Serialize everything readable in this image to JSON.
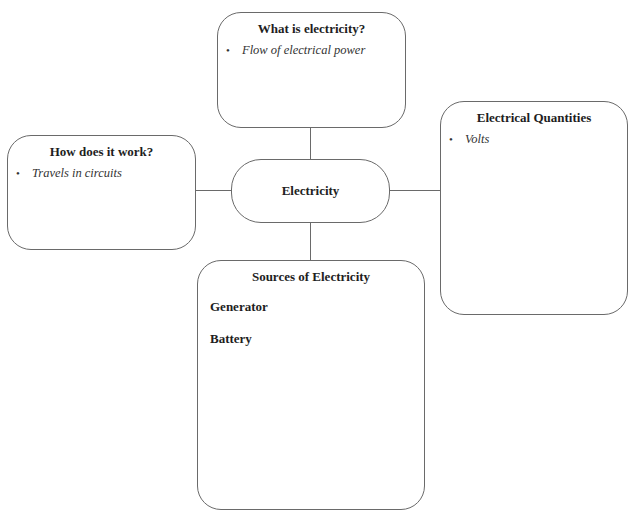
{
  "diagram": {
    "type": "concept-map",
    "center": {
      "label": "Electricity"
    },
    "nodes": [
      {
        "id": "top",
        "title": "What is electricity?",
        "bullets": [
          "Flow of electrical power"
        ]
      },
      {
        "id": "left",
        "title": "How does it work?",
        "bullets": [
          "Travels in circuits"
        ]
      },
      {
        "id": "right",
        "title": "Electrical Quantities",
        "bullets": [
          "Volts"
        ]
      },
      {
        "id": "bottom",
        "title": "Sources of Electricity",
        "items": [
          "Generator",
          "Battery"
        ]
      }
    ],
    "bullet_glyph": "•",
    "colors": {
      "border": "#6a6a6a",
      "background": "#ffffff",
      "text": "#1e1e1e"
    }
  }
}
